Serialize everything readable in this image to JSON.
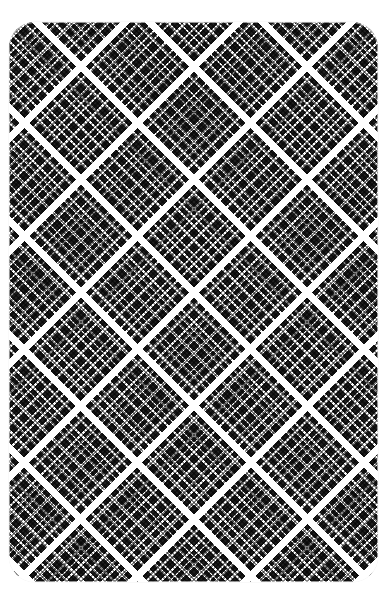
{
  "canvas": {
    "width": 389,
    "height": 606,
    "background_color": "#ffffff"
  },
  "swatch": {
    "title": "Diagonal Plaid Pattern Swatch",
    "shape": "rounded-rectangle",
    "corner_radius_px": 26,
    "x": 9,
    "y": 22,
    "width": 369,
    "height": 560,
    "colors": {
      "dark": "#1e1e1e",
      "light": "#ffffff",
      "background": "#ffffff"
    },
    "pattern": {
      "name": "tartan-plaid",
      "orientation_degrees": 45,
      "repeat_px": 80,
      "axes": [
        "warp",
        "weft"
      ],
      "stripe_sequence": [
        {
          "type": "major-band",
          "start": 0,
          "end": 7,
          "color": "#ffffff",
          "weight": "thick"
        },
        {
          "type": "medium-line",
          "start": 12,
          "end": 15,
          "color": "#ffffff",
          "weight": "medium"
        },
        {
          "type": "fine-line",
          "start": 23,
          "end": 25,
          "color": "#ffffff",
          "weight": "fine"
        },
        {
          "type": "fine-line",
          "start": 29,
          "end": 31,
          "color": "#ffffff",
          "weight": "fine"
        },
        {
          "type": "fine-line",
          "start": 35,
          "end": 37,
          "color": "#ffffff",
          "weight": "fine"
        },
        {
          "type": "medium-line",
          "start": 45,
          "end": 48,
          "color": "#ffffff",
          "weight": "medium"
        },
        {
          "type": "fine-line",
          "start": 56,
          "end": 58,
          "color": "#ffffff",
          "weight": "fine"
        },
        {
          "type": "fine-line",
          "start": 62,
          "end": 64,
          "color": "#ffffff",
          "weight": "fine"
        },
        {
          "type": "medium-line",
          "start": 70,
          "end": 73,
          "color": "#ffffff",
          "weight": "medium"
        }
      ],
      "weave_texture": {
        "type": "dither-dash",
        "pitch_px": 3.4,
        "dash_px": 1.6,
        "opacity": 0.55
      }
    }
  }
}
